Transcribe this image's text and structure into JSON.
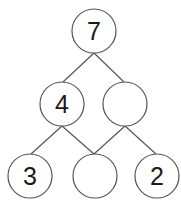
{
  "diagram": {
    "type": "number-bond-pyramid",
    "stroke_color": "#555555",
    "fill_color": "#ffffff",
    "text_color": "#1a1a1a",
    "nodes": [
      {
        "id": "top",
        "label": "7",
        "cx": 94,
        "cy": 31,
        "r": 22
      },
      {
        "id": "mid-left",
        "label": "4",
        "cx": 62,
        "cy": 104,
        "r": 22
      },
      {
        "id": "mid-right",
        "label": "",
        "cx": 125,
        "cy": 104,
        "r": 22
      },
      {
        "id": "bottom-left",
        "label": "3",
        "cx": 30,
        "cy": 176,
        "r": 22
      },
      {
        "id": "bottom-middle",
        "label": "",
        "cx": 95,
        "cy": 176,
        "r": 22
      },
      {
        "id": "bottom-right",
        "label": "2",
        "cx": 157,
        "cy": 176,
        "r": 22
      }
    ],
    "edges": [
      {
        "from": "top",
        "to": "mid-left"
      },
      {
        "from": "top",
        "to": "mid-right"
      },
      {
        "from": "mid-left",
        "to": "bottom-left"
      },
      {
        "from": "mid-left",
        "to": "bottom-middle"
      },
      {
        "from": "mid-right",
        "to": "bottom-middle"
      },
      {
        "from": "mid-right",
        "to": "bottom-right"
      }
    ]
  }
}
